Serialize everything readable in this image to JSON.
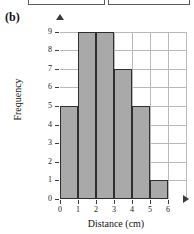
{
  "part_label": "(b)",
  "top_boxes": [
    {
      "name": "cropped-box-left"
    },
    {
      "name": "cropped-box-right"
    }
  ],
  "chart_data": {
    "type": "bar",
    "title": "",
    "subtitle": "",
    "xlabel": "Distance (cm)",
    "ylabel": "Frequency",
    "xlim": [
      0,
      6
    ],
    "ylim": [
      0,
      9
    ],
    "grid": true,
    "legend": null,
    "bin_width": 1,
    "bin_edges": [
      0,
      1,
      2,
      3,
      4,
      5,
      6
    ],
    "categories": [
      "0-1",
      "1-2",
      "2-3",
      "3-4",
      "4-5",
      "5-6"
    ],
    "values": [
      5,
      9,
      9,
      7,
      5,
      1
    ],
    "xticklabels": [
      "0",
      "1",
      "2",
      "3",
      "4",
      "5",
      "6"
    ],
    "yticklabels": [
      "0",
      "1",
      "2",
      "3",
      "4",
      "5",
      "6",
      "7",
      "8",
      "9"
    ],
    "bar_fill_color": "#a9a9a9",
    "bar_edge_color": "#2e2e2e",
    "grid_color": "#b9b9b9",
    "axis_color": "#3a3a3a"
  }
}
